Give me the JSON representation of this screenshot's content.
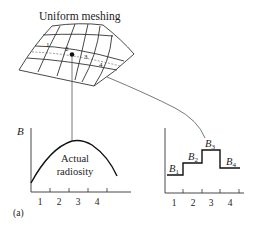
{
  "title": "Uniform meshing",
  "mesh": {
    "patch_labels": [
      "1",
      "2",
      "3",
      "4"
    ]
  },
  "left_plot": {
    "y_label": "B",
    "curve_label_line1": "Actual",
    "curve_label_line2": "radiosity",
    "x_ticks": [
      "1",
      "2",
      "3",
      "4"
    ],
    "panel_label": "(a)"
  },
  "right_plot": {
    "step_labels": [
      {
        "base": "B",
        "sub": "1"
      },
      {
        "base": "B",
        "sub": "2"
      },
      {
        "base": "B",
        "sub": "3"
      },
      {
        "base": "B",
        "sub": "4"
      }
    ],
    "x_ticks": [
      "1",
      "2",
      "3",
      "4"
    ]
  },
  "colors": {
    "ink": "#222222",
    "background": "#ffffff"
  }
}
